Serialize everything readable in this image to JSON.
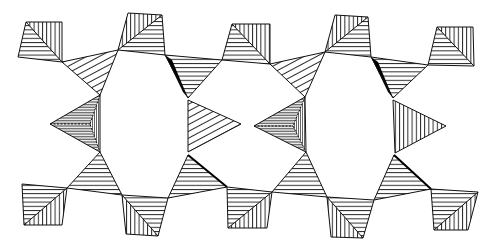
{
  "figure": {
    "title": "",
    "hatch_color": "#111111",
    "background_color": "#ffffff",
    "units": {
      "top_tetrahedra_count": 5,
      "bottom_tetrahedra_count": 5,
      "link_tetrahedra_top_count": 4,
      "link_tetrahedra_bottom_count": 4,
      "central_left_triangles": 2,
      "central_right_triangles": 2
    }
  }
}
